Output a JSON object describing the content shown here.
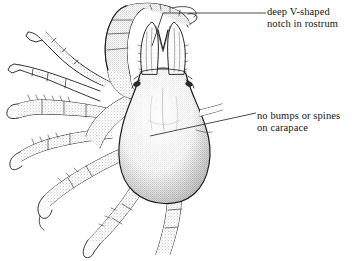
{
  "figure": {
    "background_color": "#ffffff",
    "ink_color": "#1a1a1a",
    "stipple_color": "#4a4a4a"
  },
  "callouts": [
    {
      "id": "rostrum",
      "line1": "deep V-shaped",
      "line2": "notch in rostrum",
      "target": "rostral notch"
    },
    {
      "id": "carapace",
      "line1": "no bumps or spines",
      "line2": "on carapace",
      "target": "carapace surface"
    }
  ],
  "caption": {
    "text": ""
  },
  "anatomy": {
    "cheliped_label": "cheliped",
    "carapace_label": "carapace",
    "rostrum_label": "rostrum",
    "walking_legs_label": "walking legs"
  }
}
